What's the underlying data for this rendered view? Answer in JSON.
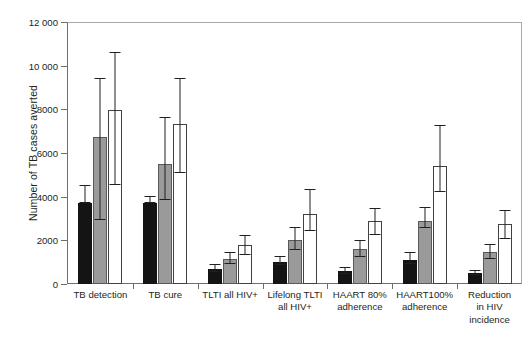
{
  "chart_data": {
    "type": "bar",
    "title": "",
    "xlabel": "",
    "ylabel": "Number of TB cases averted",
    "ylim": [
      0,
      12000
    ],
    "ytick_values": [
      0,
      2000,
      4000,
      6000,
      8000,
      10000,
      12000
    ],
    "ytick_labels": [
      "0",
      "2000",
      "4000",
      "6000",
      "8000",
      "10 000",
      "12 000"
    ],
    "grid": false,
    "legend": "none",
    "categories": [
      "TB detection",
      "TB cure",
      "TLTI all HIV+",
      "Lifelong TLTI all HIV+",
      "HAART 80% adherence",
      "HAART100% adherence",
      "Reduction in HIV incidence"
    ],
    "category_lines": [
      [
        "TB detection"
      ],
      [
        "TB cure"
      ],
      [
        "TLTI all HIV+"
      ],
      [
        "Lifelong TLTI",
        "all HIV+"
      ],
      [
        "HAART 80%",
        "adherence"
      ],
      [
        "HAART100%",
        "adherence"
      ],
      [
        "Reduction",
        "in HIV",
        "incidence"
      ]
    ],
    "series": [
      {
        "name": "series-1-black",
        "color": "#141414",
        "values": [
          3700,
          3700,
          700,
          1000,
          600,
          1100,
          500
        ],
        "err_low": [
          3700,
          3700,
          550,
          870,
          480,
          900,
          420
        ],
        "err_high": [
          4550,
          4050,
          900,
          1280,
          790,
          1480,
          640
        ]
      },
      {
        "name": "series-2-grey",
        "color": "#9a9a9a",
        "values": [
          6750,
          5500,
          1150,
          2000,
          1600,
          2900,
          1450
        ],
        "err_low": [
          2950,
          3850,
          900,
          1550,
          1250,
          2550,
          1150
        ],
        "err_high": [
          9450,
          7650,
          1450,
          2600,
          2020,
          3550,
          1850
        ]
      },
      {
        "name": "series-3-white",
        "color": "#ffffff",
        "values": [
          7950,
          7350,
          1800,
          3200,
          2900,
          5400,
          2750
        ],
        "err_low": [
          4550,
          5100,
          1350,
          2450,
          2230,
          4200,
          2050
        ],
        "err_high": [
          10650,
          9450,
          2250,
          4350,
          3500,
          7300,
          3400
        ]
      }
    ]
  }
}
